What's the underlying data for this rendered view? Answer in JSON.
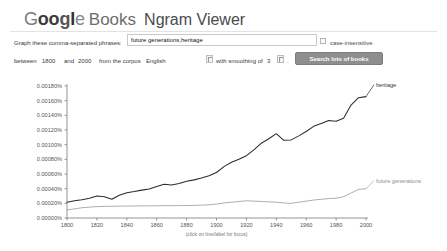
{
  "header": {
    "logo_letters": [
      "G",
      "o",
      "o",
      "g",
      "l",
      "e"
    ],
    "books": "Books",
    "product": "Ngram Viewer"
  },
  "form": {
    "phrase_label": "Graph these comma-separated phrases:",
    "phrase_value": "future generations,heritage",
    "phrase_placeholder": "",
    "case_insensitive_label": "case-insensitive",
    "between_label": "between",
    "year_from": "1800",
    "and_label": "and",
    "year_to": "2000",
    "corpus_label": "from the corpus",
    "corpus_value": "English",
    "smoothing_label": "with smoothing of",
    "smoothing_value": "3",
    "period": ".",
    "search_button": "Search lots of books"
  },
  "chart_hint": "(click on line/label for focus)",
  "colors": {
    "heritage": "#2b2b2b",
    "future_generations": "#9e9e9e",
    "axis": "#7a7a7a",
    "button": "#8e8e8e"
  },
  "chart_data": {
    "type": "line",
    "title": "",
    "xlabel": "",
    "ylabel": "",
    "xlim": [
      1800,
      2000
    ],
    "ylim": [
      0.0,
      0.0018
    ],
    "grid": false,
    "legend_position": "right-inline",
    "xticks": [
      1800,
      1820,
      1840,
      1860,
      1880,
      1900,
      1920,
      1940,
      1960,
      1980,
      2000
    ],
    "yticks": [
      0.0,
      0.0002,
      0.0004,
      0.0006,
      0.0008,
      0.001,
      0.0012,
      0.0014,
      0.0016,
      0.0018
    ],
    "ytick_labels": [
      "0.00000%",
      "0.00020%",
      "0.00040%",
      "0.00060%",
      "0.00080%",
      "0.00100%",
      "0.00120%",
      "0.00140%",
      "0.00160%",
      "0.00180%"
    ],
    "xtick_labels": [
      "1800",
      "1820",
      "1840",
      "1860",
      "1880",
      "1900",
      "1920",
      "1940",
      "1960",
      "1980",
      "2000"
    ],
    "x": [
      1800,
      1805,
      1810,
      1815,
      1820,
      1825,
      1830,
      1835,
      1840,
      1845,
      1850,
      1855,
      1860,
      1865,
      1870,
      1875,
      1880,
      1885,
      1890,
      1895,
      1900,
      1905,
      1910,
      1915,
      1920,
      1925,
      1930,
      1935,
      1940,
      1945,
      1950,
      1955,
      1960,
      1965,
      1970,
      1975,
      1980,
      1985,
      1990,
      1995,
      2000
    ],
    "series": [
      {
        "name": "heritage",
        "color": "#2b2b2b",
        "label": "heritage",
        "values": [
          0.000215,
          0.000235,
          0.00025,
          0.00027,
          0.0003,
          0.00029,
          0.000255,
          0.00031,
          0.000345,
          0.00036,
          0.00038,
          0.000395,
          0.00043,
          0.00046,
          0.00045,
          0.00047,
          0.0005,
          0.00052,
          0.000545,
          0.000575,
          0.00062,
          0.0007,
          0.00076,
          0.0008,
          0.00085,
          0.00093,
          0.00102,
          0.00108,
          0.00115,
          0.00106,
          0.001065,
          0.00112,
          0.00118,
          0.00125,
          0.00129,
          0.00133,
          0.00132,
          0.00136,
          0.00154,
          0.00164,
          0.001655
        ]
      },
      {
        "name": "future generations",
        "color": "#9e9e9e",
        "label": "future generations",
        "values": [
          0.00011,
          0.000125,
          0.00014,
          0.000148,
          0.000155,
          0.000158,
          0.00016,
          0.000162,
          0.000163,
          0.000164,
          0.000165,
          0.000166,
          0.000167,
          0.000168,
          0.000168,
          0.000169,
          0.00017,
          0.000172,
          0.000175,
          0.00018,
          0.00019,
          0.000205,
          0.000215,
          0.000225,
          0.000235,
          0.00023,
          0.000225,
          0.00022,
          0.000215,
          0.000205,
          0.0002,
          0.000215,
          0.00023,
          0.000245,
          0.000255,
          0.000265,
          0.00027,
          0.00029,
          0.00034,
          0.00039,
          0.0004
        ]
      }
    ]
  }
}
